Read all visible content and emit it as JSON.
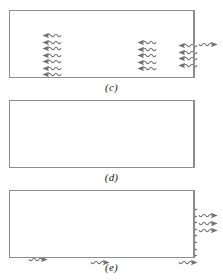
{
  "figure": {
    "type": "physics-diagram",
    "background_color": "#ffffff",
    "frame_color": "#8d8d8f",
    "photon_color": "#6e6e72",
    "label_color": "#1a1a1a",
    "panels": [
      {
        "id": "c",
        "label": "(c)",
        "frame": {
          "x": 9,
          "y": 10,
          "width": 186,
          "height": 68
        },
        "groups": [
          {
            "name": "left-photon-burst",
            "direction": "left",
            "count": 7,
            "x": 32,
            "y": 21,
            "spacing": 6.5
          },
          {
            "name": "middle-photon-burst",
            "direction": "left",
            "count": 5,
            "x": 127,
            "y": 28,
            "spacing": 6.5
          },
          {
            "name": "right-photon-burst",
            "direction": "left",
            "count": 4,
            "x": 168,
            "y": 31,
            "spacing": 6.5
          }
        ],
        "emitted": {
          "name": "emitted-photon",
          "direction": "right",
          "count": 1,
          "x": 196,
          "y": 41,
          "spacing": 6.5
        }
      },
      {
        "id": "d",
        "label": "(d)",
        "frame": {
          "x": 9,
          "y": 100,
          "width": 186,
          "height": 68
        },
        "groups": [
          {
            "name": "left-photon-burst",
            "direction": "right",
            "count": 6,
            "x": 16,
            "y": 122,
            "spacing": 6.6
          },
          {
            "name": "middle-photon-burst",
            "direction": "right",
            "count": 9,
            "x": 78,
            "y": 105,
            "spacing": 6.6
          },
          {
            "name": "right-photon-burst",
            "direction": "right",
            "count": 9,
            "x": 166,
            "y": 105,
            "spacing": 6.6
          }
        ],
        "emitted": null
      },
      {
        "id": "e",
        "label": "(e)",
        "frame": {
          "x": 9,
          "y": 190,
          "width": 186,
          "height": 68
        },
        "groups": [
          {
            "name": "right-photon-burst",
            "direction": "left",
            "count": 8,
            "x": 162,
            "y": 196,
            "spacing": 6.6
          }
        ],
        "emitted": {
          "name": "emitted-photon-beam",
          "direction": "right",
          "count": 3,
          "x": 196,
          "y": 212,
          "spacing": 7.5
        }
      }
    ]
  }
}
